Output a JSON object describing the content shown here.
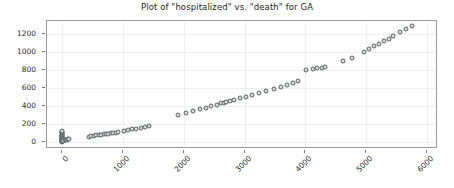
{
  "chart_data": {
    "type": "scatter",
    "title": "Plot of \"hospitalized\" vs. \"death\" for GA",
    "xlabel": "",
    "ylabel": "",
    "xlim": [
      -250,
      6150
    ],
    "ylim": [
      -60,
      1340
    ],
    "xticks": [
      0,
      1000,
      2000,
      3000,
      4000,
      5000,
      6000
    ],
    "yticks": [
      0,
      200,
      400,
      600,
      800,
      1000,
      1200
    ],
    "xtick_labels": [
      "0",
      "1000",
      "2000",
      "3000",
      "4000",
      "5000",
      "6000"
    ],
    "ytick_labels": [
      "0",
      "200",
      "400",
      "600",
      "800",
      "1000",
      "1200"
    ],
    "xtick_rotation": -45,
    "grid": true,
    "legend": null,
    "marker": "o",
    "marker_facecolor": "#dcdcdc",
    "marker_edgecolor": "#5a5f66",
    "marker_size": 5,
    "series": [
      {
        "name": "hospitalized vs death",
        "x": [
          0,
          0,
          0,
          0,
          0,
          0,
          0,
          0,
          0,
          0,
          0,
          0,
          0,
          0,
          0,
          0,
          0,
          0,
          0,
          0,
          0,
          20,
          40,
          60,
          80,
          100,
          120,
          440,
          480,
          520,
          560,
          600,
          640,
          680,
          720,
          760,
          800,
          840,
          880,
          920,
          1010,
          1080,
          1150,
          1220,
          1290,
          1360,
          1430,
          1900,
          2030,
          2150,
          2260,
          2360,
          2450,
          2540,
          2610,
          2660,
          2700,
          2760,
          2830,
          2930,
          3030,
          3130,
          3240,
          3350,
          3480,
          3600,
          3700,
          3790,
          3880,
          4010,
          4120,
          4200,
          4270,
          4330,
          4620,
          4760,
          4960,
          5050,
          5130,
          5210,
          5290,
          5370,
          5450,
          5560,
          5660,
          5760
        ],
        "y": [
          0,
          2,
          5,
          8,
          12,
          16,
          20,
          25,
          30,
          36,
          42,
          48,
          55,
          62,
          70,
          78,
          86,
          95,
          104,
          112,
          120,
          10,
          14,
          18,
          22,
          26,
          30,
          55,
          60,
          64,
          68,
          72,
          76,
          80,
          84,
          88,
          92,
          96,
          100,
          104,
          120,
          128,
          136,
          144,
          152,
          162,
          172,
          300,
          320,
          340,
          360,
          378,
          394,
          412,
          425,
          432,
          438,
          448,
          460,
          480,
          500,
          518,
          538,
          558,
          585,
          610,
          632,
          652,
          672,
          800,
          812,
          818,
          822,
          826,
          900,
          932,
          1000,
          1030,
          1060,
          1090,
          1118,
          1145,
          1172,
          1218,
          1252,
          1282
        ]
      }
    ]
  }
}
